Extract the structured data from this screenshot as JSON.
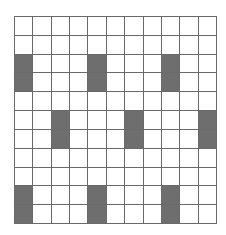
{
  "grid": {
    "rows": 11,
    "cols": 11,
    "colors": {
      "empty": "#ffffff",
      "shaded": "#6e6e6e",
      "line": "#6a6a6a"
    },
    "shaded_cells": [
      [
        2,
        0
      ],
      [
        3,
        0
      ],
      [
        2,
        4
      ],
      [
        3,
        4
      ],
      [
        2,
        8
      ],
      [
        3,
        8
      ],
      [
        5,
        2
      ],
      [
        6,
        2
      ],
      [
        5,
        6
      ],
      [
        6,
        6
      ],
      [
        5,
        10
      ],
      [
        6,
        10
      ],
      [
        9,
        0
      ],
      [
        10,
        0
      ],
      [
        9,
        4
      ],
      [
        10,
        4
      ],
      [
        9,
        8
      ],
      [
        10,
        8
      ]
    ]
  }
}
